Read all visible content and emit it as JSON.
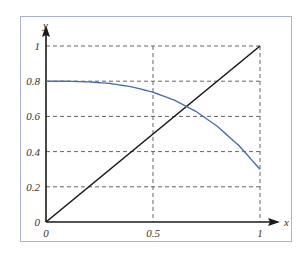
{
  "chart_data": {
    "type": "line",
    "title": "",
    "xlabel": "x",
    "ylabel": "y",
    "xlim": [
      0,
      1
    ],
    "ylim": [
      0,
      1
    ],
    "grid": true,
    "grid_style": "dashed",
    "x_ticks": [
      0,
      0.5,
      1
    ],
    "x_tick_labels": [
      "0",
      "0.5",
      "1"
    ],
    "y_ticks": [
      0,
      0.2,
      0.4,
      0.6,
      0.8,
      1
    ],
    "y_tick_labels": [
      "0",
      "0.2",
      "0.4",
      "0.6",
      "0.8",
      "1"
    ],
    "legend": null,
    "series": [
      {
        "name": "line y = x",
        "color": "#1a1a1a",
        "x": [
          0,
          1
        ],
        "y": [
          0,
          1
        ]
      },
      {
        "name": "curve",
        "color": "#4a6fa5",
        "x": [
          0,
          0.1,
          0.2,
          0.3,
          0.4,
          0.5,
          0.6,
          0.7,
          0.8,
          0.9,
          1.0
        ],
        "y": [
          0.8,
          0.8,
          0.796,
          0.787,
          0.768,
          0.738,
          0.692,
          0.629,
          0.544,
          0.436,
          0.3
        ]
      }
    ],
    "annotations": []
  },
  "axes": {
    "x_label": "x",
    "y_label": "y",
    "x_tick_labels": [
      "0",
      "0.5",
      "1"
    ],
    "y_tick_labels": [
      "0",
      "0.2",
      "0.4",
      "0.6",
      "0.8",
      "1"
    ]
  },
  "colors": {
    "axis": "#1a1a1a",
    "grid": "#555555",
    "frame": "#aab4c8",
    "curve": "#4a6fa5",
    "line": "#1a1a1a"
  }
}
